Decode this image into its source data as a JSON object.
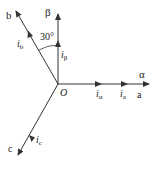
{
  "diagram": {
    "type": "vector-diagram",
    "title": "",
    "colors": {
      "line": "#333333",
      "text": "#222222",
      "background": "#ffffff"
    },
    "origin": {
      "label": "O",
      "x": 58,
      "y": 84
    },
    "axes": [
      {
        "id": "alpha",
        "label": "α",
        "direction_deg": 0
      },
      {
        "id": "beta",
        "label": "β",
        "direction_deg": 90
      },
      {
        "id": "a",
        "label": "a",
        "direction_deg": 0
      },
      {
        "id": "b",
        "label": "b",
        "direction_deg": 120
      },
      {
        "id": "c",
        "label": "c",
        "direction_deg": 240
      }
    ],
    "vectors": [
      {
        "id": "i_alpha",
        "label_main": "i",
        "label_sub": "α",
        "on_axis": "alpha"
      },
      {
        "id": "i_a",
        "label_main": "i",
        "label_sub": "a",
        "on_axis": "a"
      },
      {
        "id": "i_beta",
        "label_main": "i",
        "label_sub": "β",
        "on_axis": "beta"
      },
      {
        "id": "i_b",
        "label_main": "i",
        "label_sub": "b",
        "on_axis": "b"
      },
      {
        "id": "i_c",
        "label_main": "i",
        "label_sub": "c",
        "on_axis": "c"
      }
    ],
    "angle_annotation": {
      "label": "30°",
      "between": [
        "beta",
        "b"
      ]
    }
  }
}
